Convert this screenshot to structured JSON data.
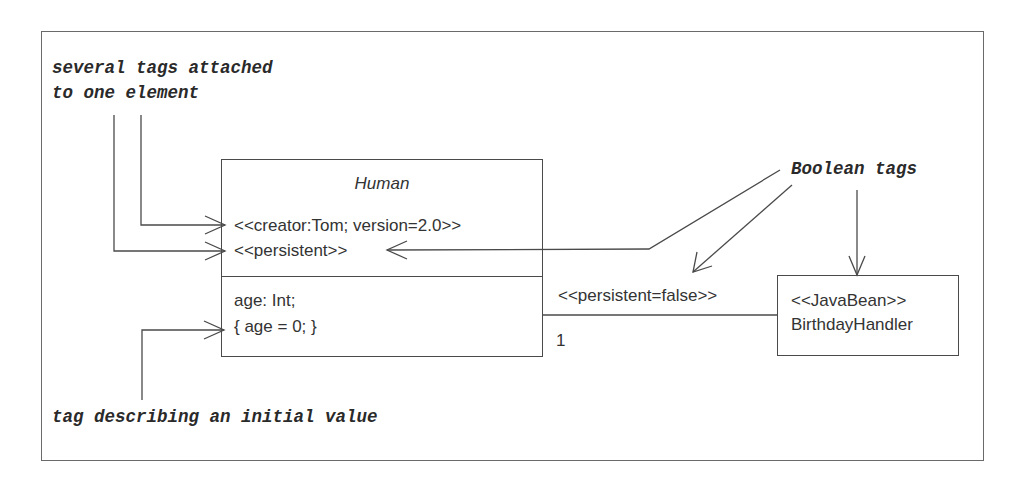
{
  "annotations": {
    "several_tags": "several tags attached\nto one element",
    "boolean_tags": "Boolean tags",
    "initial_value": "tag describing an initial value"
  },
  "human_class": {
    "name": "Human",
    "tags": [
      "<<creator:Tom; version=2.0>>",
      "<<persistent>>"
    ],
    "attributes": [
      "age: Int;",
      "{ age = 0; }"
    ]
  },
  "birthday_handler_class": {
    "stereotype": "<<JavaBean>>",
    "name": "BirthdayHandler"
  },
  "association": {
    "tag": "<<persistent=false>>",
    "multiplicity": "1"
  },
  "colors": {
    "line": "#4a4a4a",
    "text": "#333333",
    "frame": "#6a6a6a",
    "background": "#ffffff"
  }
}
